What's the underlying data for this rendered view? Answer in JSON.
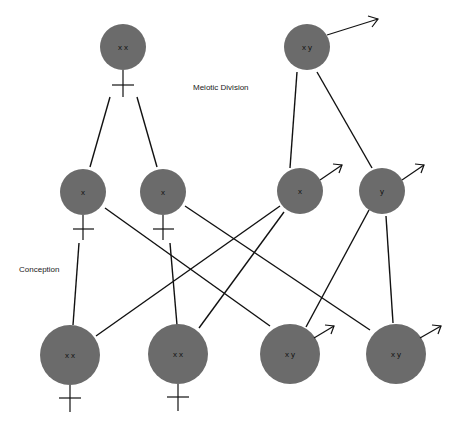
{
  "diagram": {
    "labels": {
      "meiotic_division": "Meiotic Division",
      "conception": "Conception"
    },
    "colors": {
      "cell_fill": "#6b6b6b",
      "line": "#111111",
      "background": "#ffffff"
    },
    "parents": [
      {
        "id": "mother",
        "chromosomes": "x x",
        "sex_symbol": "female-symbol"
      },
      {
        "id": "father",
        "chromosomes": "x y",
        "sex_symbol": "male-symbol"
      }
    ],
    "gametes": [
      {
        "id": "egg-1",
        "chromosomes": "x",
        "sex_symbol": "female-symbol"
      },
      {
        "id": "egg-2",
        "chromosomes": "x",
        "sex_symbol": "female-symbol"
      },
      {
        "id": "sperm-x",
        "chromosomes": "x",
        "sex_symbol": "male-symbol"
      },
      {
        "id": "sperm-y",
        "chromosomes": "y",
        "sex_symbol": "male-symbol"
      }
    ],
    "offspring": [
      {
        "id": "child-1",
        "chromosomes": "x x",
        "sex_symbol": "female-symbol"
      },
      {
        "id": "child-2",
        "chromosomes": "x x",
        "sex_symbol": "female-symbol"
      },
      {
        "id": "child-3",
        "chromosomes": "x y",
        "sex_symbol": "male-symbol"
      },
      {
        "id": "child-4",
        "chromosomes": "x y",
        "sex_symbol": "male-symbol"
      }
    ]
  }
}
